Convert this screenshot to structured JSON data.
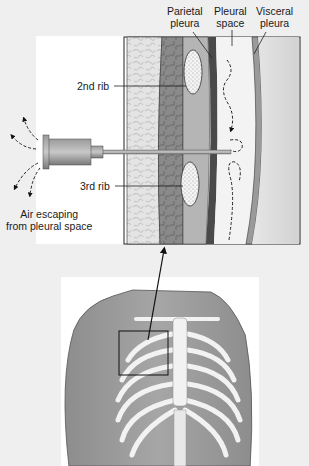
{
  "figure": {
    "labels": {
      "parietal_pleura": [
        "Parietal",
        "pleura"
      ],
      "pleural_space": [
        "Pleural",
        "space"
      ],
      "visceral_pleura": [
        "Visceral",
        "pleura"
      ],
      "second_rib": "2nd rib",
      "third_rib": "3rd rib",
      "air_escaping": [
        "Air escaping",
        "from pleural space"
      ]
    }
  }
}
